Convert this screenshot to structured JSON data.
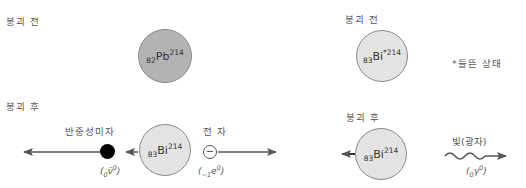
{
  "left_panel": {
    "before_label": "붕괴 전",
    "after_label": "붕괴 후",
    "parent": {
      "sub": "82",
      "symbol": "Pb",
      "sup": "214",
      "fill": "#b3b3b3"
    },
    "daughter": {
      "sub": "83",
      "symbol": "Bi",
      "sup": "214",
      "fill": "#e3e3e3"
    },
    "antineutrino": {
      "label": "반중성미자",
      "formula_pre": "(",
      "formula_sub": "0",
      "formula_sym": "ν̄",
      "formula_sup": "0",
      "formula_post": ")"
    },
    "electron": {
      "label": "전 자",
      "symbol": "−",
      "formula_pre": "(",
      "formula_sub": "−1",
      "formula_sym": "e",
      "formula_sup": "0",
      "formula_post": ")"
    }
  },
  "right_panel": {
    "before_label": "붕괴 전",
    "after_label": "붕괴 후",
    "parent": {
      "sub": "83",
      "symbol": "Bi",
      "sup": "*214",
      "fill": "#e3e3e3"
    },
    "excited_note": "*들뜬 상태",
    "daughter": {
      "sub": "83",
      "symbol": "Bi",
      "sup": "214",
      "fill": "#e3e3e3"
    },
    "photon": {
      "label": "빛(광자)",
      "formula_pre": "(",
      "formula_sub": "0",
      "formula_sym": "γ",
      "formula_sup": "0",
      "formula_post": ")"
    }
  },
  "colors": {
    "arrow": "#555555",
    "antineutrino_fill": "#000000",
    "circle_border": "#8a8a8a"
  }
}
